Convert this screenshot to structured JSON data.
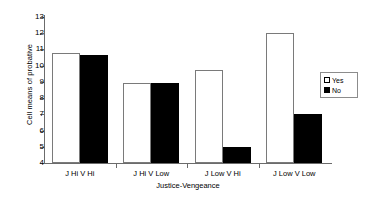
{
  "chart_data": {
    "type": "bar",
    "title": "",
    "xlabel": "Justice-Vengeance",
    "ylabel": "Cell means of probative",
    "categories": [
      "J Hi V Hi",
      "J Hi V Low",
      "J Low V Hi",
      "J Low V Low"
    ],
    "series": [
      {
        "name": "Yes",
        "values": [
          10.8,
          8.95,
          9.75,
          12.0
        ],
        "color": "#ffffff",
        "edge_color": "#7a7a7a"
      },
      {
        "name": "No",
        "values": [
          10.65,
          8.95,
          5.0,
          7.0
        ],
        "color": "#000000",
        "edge_color": "#000000"
      }
    ],
    "ylim": [
      4,
      13
    ],
    "yticks": [
      4,
      5,
      6,
      7,
      8,
      9,
      10,
      11,
      12,
      13
    ],
    "ytick_labels": [
      "4",
      "5",
      "6",
      "7",
      "8",
      "9",
      "10",
      "11",
      "12",
      "13"
    ],
    "grid": false,
    "legend_position": "right",
    "legend_entries": [
      {
        "label": "Yes",
        "marker": "open-square"
      },
      {
        "label": "No",
        "marker": "filled-square"
      }
    ]
  }
}
